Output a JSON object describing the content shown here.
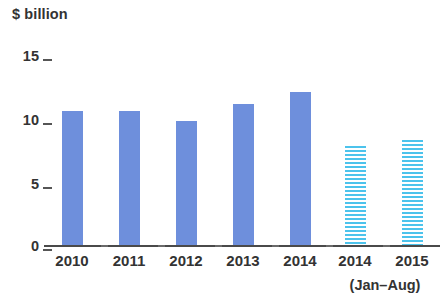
{
  "chart_data": {
    "type": "bar",
    "title": "",
    "subtitle": "",
    "ylabel": "$ billion",
    "xlabel": "",
    "categories": [
      "2010",
      "2011",
      "2012",
      "2013",
      "2014",
      "2014",
      "2015"
    ],
    "values": [
      10.7,
      10.7,
      9.9,
      11.2,
      12.2,
      7.9,
      8.4
    ],
    "series": [
      {
        "name": "Full year",
        "values": [
          10.7,
          10.7,
          9.9,
          11.2,
          12.2,
          null,
          null
        ],
        "style": "solid",
        "color": "#6e8fdc"
      },
      {
        "name": "Jan-Aug",
        "values": [
          null,
          null,
          null,
          null,
          null,
          7.9,
          8.4
        ],
        "style": "hatched",
        "color": "#4cc3ec"
      }
    ],
    "bar_styles": [
      "solid",
      "solid",
      "solid",
      "solid",
      "solid",
      "hatched",
      "hatched"
    ],
    "ylim": [
      0,
      15
    ],
    "yticks": [
      0,
      5,
      10,
      15
    ],
    "ytick_labels": [
      "0",
      "5",
      "10",
      "15"
    ],
    "grid": false,
    "legend": false,
    "annotations": [
      {
        "text": "(Jan–Aug)",
        "applies_to": [
          "2014",
          "2015"
        ],
        "position": "below-last-two-x-labels"
      }
    ]
  },
  "axis": {
    "y_title": "$ billion"
  },
  "notes": {
    "period_note": "(Jan–Aug)"
  },
  "colors": {
    "solid_bar": "#6e8fdc",
    "hatched_bar": "#4cc3ec",
    "axis": "#4a4a4a",
    "text": "#333333",
    "background": "#ffffff"
  }
}
